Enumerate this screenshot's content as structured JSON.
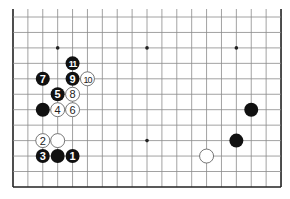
{
  "diagram": {
    "type": "go-board-partial",
    "columns": 19,
    "rows_visible": 12,
    "edges": [
      "left",
      "right",
      "bottom"
    ],
    "grid": {
      "x0": 13,
      "y0": 17,
      "dx": 14.89,
      "dy": 15.45,
      "top_extend_y": 9
    },
    "colors": {
      "line": "#8a8a8a",
      "border": "#222222",
      "black_stone": "#111111",
      "white_stone": "#ffffff",
      "white_text": "#ffffff",
      "black_text": "#222222"
    },
    "star_points": [
      {
        "col": 3,
        "row": 2
      },
      {
        "col": 9,
        "row": 2
      },
      {
        "col": 15,
        "row": 2
      },
      {
        "col": 9,
        "row": 8
      }
    ],
    "stones": [
      {
        "color": "black",
        "col": 4,
        "row": 9,
        "label": "1"
      },
      {
        "color": "white",
        "col": 2,
        "row": 8,
        "label": "2"
      },
      {
        "color": "black",
        "col": 2,
        "row": 9,
        "label": "3"
      },
      {
        "color": "white",
        "col": 3,
        "row": 6,
        "label": "4"
      },
      {
        "color": "black",
        "col": 3,
        "row": 5,
        "label": "5"
      },
      {
        "color": "white",
        "col": 4,
        "row": 6,
        "label": "6"
      },
      {
        "color": "black",
        "col": 2,
        "row": 4,
        "label": "7"
      },
      {
        "color": "white",
        "col": 4,
        "row": 5,
        "label": "8"
      },
      {
        "color": "black",
        "col": 4,
        "row": 4,
        "label": "9"
      },
      {
        "color": "white",
        "col": 5,
        "row": 4,
        "label": "10"
      },
      {
        "color": "black",
        "col": 4,
        "row": 3,
        "label": "11"
      },
      {
        "color": "black",
        "col": 2,
        "row": 6,
        "label": ""
      },
      {
        "color": "white",
        "col": 3,
        "row": 8,
        "label": ""
      },
      {
        "color": "black",
        "col": 3,
        "row": 9,
        "label": ""
      },
      {
        "color": "black",
        "col": 16,
        "row": 6,
        "label": ""
      },
      {
        "color": "black",
        "col": 15,
        "row": 8,
        "label": ""
      },
      {
        "color": "white",
        "col": 13,
        "row": 9,
        "label": ""
      }
    ]
  }
}
